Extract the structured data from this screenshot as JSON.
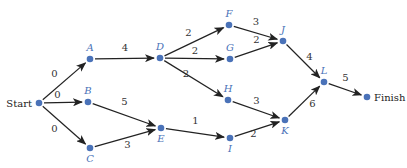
{
  "diagram": {
    "type": "activity-network",
    "colors": {
      "node": "#4a72b8",
      "edge": "#222222",
      "label": "#4a72b8",
      "weight": "#333333"
    },
    "nodes": [
      {
        "id": "Start",
        "label": "Start",
        "x": 39,
        "y": 103,
        "kind": "endpoint"
      },
      {
        "id": "A",
        "label": "A",
        "x": 90,
        "y": 59
      },
      {
        "id": "B",
        "label": "B",
        "x": 88,
        "y": 102
      },
      {
        "id": "C",
        "label": "C",
        "x": 90,
        "y": 148
      },
      {
        "id": "D",
        "label": "D",
        "x": 160,
        "y": 58
      },
      {
        "id": "E",
        "label": "E",
        "x": 161,
        "y": 128
      },
      {
        "id": "F",
        "label": "F",
        "x": 229,
        "y": 25
      },
      {
        "id": "G",
        "label": "G",
        "x": 230,
        "y": 59
      },
      {
        "id": "H",
        "label": "H",
        "x": 228,
        "y": 100
      },
      {
        "id": "I",
        "label": "I",
        "x": 230,
        "y": 138
      },
      {
        "id": "J",
        "label": "J",
        "x": 283,
        "y": 41
      },
      {
        "id": "K",
        "label": "K",
        "x": 285,
        "y": 120
      },
      {
        "id": "L",
        "label": "L",
        "x": 324,
        "y": 82
      },
      {
        "id": "Finish",
        "label": "Finish",
        "x": 367,
        "y": 97,
        "kind": "endpoint"
      }
    ],
    "edges": [
      {
        "from": "Start",
        "to": "A",
        "weight": "0"
      },
      {
        "from": "Start",
        "to": "B",
        "weight": "0"
      },
      {
        "from": "Start",
        "to": "C",
        "weight": "0"
      },
      {
        "from": "A",
        "to": "D",
        "weight": "4"
      },
      {
        "from": "B",
        "to": "E",
        "weight": "5"
      },
      {
        "from": "C",
        "to": "E",
        "weight": "3"
      },
      {
        "from": "D",
        "to": "F",
        "weight": "2"
      },
      {
        "from": "D",
        "to": "G",
        "weight": "2"
      },
      {
        "from": "D",
        "to": "H",
        "weight": "2"
      },
      {
        "from": "E",
        "to": "I",
        "weight": "1"
      },
      {
        "from": "F",
        "to": "J",
        "weight": "3"
      },
      {
        "from": "G",
        "to": "J",
        "weight": "2"
      },
      {
        "from": "H",
        "to": "K",
        "weight": "3"
      },
      {
        "from": "I",
        "to": "K",
        "weight": "2"
      },
      {
        "from": "J",
        "to": "L",
        "weight": "4"
      },
      {
        "from": "K",
        "to": "L",
        "weight": "6"
      },
      {
        "from": "L",
        "to": "Finish",
        "weight": "5"
      }
    ]
  }
}
